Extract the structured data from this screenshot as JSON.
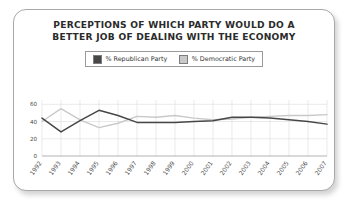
{
  "card": {
    "title_line_1": "PERCEPTIONS OF WHICH PARTY WOULD DO A",
    "title_line_2": "BETTER JOB OF DEALING WITH THE ECONOMY"
  },
  "legend": {
    "items": [
      {
        "label": "% Republican Party",
        "color": "#474747"
      },
      {
        "label": "% Democratic Party",
        "color": "#c9c9c9"
      }
    ]
  },
  "chart_data": {
    "type": "line",
    "title": "PERCEPTIONS OF WHICH PARTY WOULD DO A BETTER JOB OF DEALING WITH THE ECONOMY",
    "xlabel": "",
    "ylabel": "",
    "categories": [
      "1992",
      "1993",
      "1994",
      "1995",
      "1996",
      "1997",
      "1998",
      "1999",
      "2000",
      "2001",
      "2002",
      "2003",
      "2004",
      "2005",
      "2006",
      "2007"
    ],
    "series": [
      {
        "name": "% Republican Party",
        "color": "#474747",
        "values": [
          44,
          28,
          41,
          53,
          47,
          39,
          39,
          39,
          40,
          41,
          45,
          45,
          44,
          42,
          40,
          37
        ]
      },
      {
        "name": "% Democratic Party",
        "color": "#c9c9c9",
        "values": [
          40,
          55,
          42,
          33,
          38,
          46,
          45,
          47,
          44,
          42,
          43,
          45,
          46,
          47,
          47,
          48
        ]
      }
    ],
    "ylim": [
      0,
      65
    ],
    "yticks": [
      0,
      20,
      40,
      60
    ],
    "grid": true,
    "legend_position": "top-center"
  }
}
